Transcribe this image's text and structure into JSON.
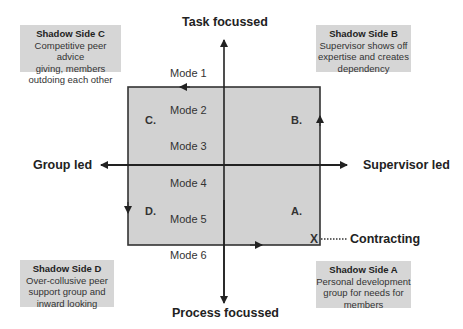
{
  "axes": {
    "top": "Task focussed",
    "bottom": "Process focussed",
    "left": "Group led",
    "right": "Supervisor led"
  },
  "modes": [
    "Mode 1",
    "Mode 2",
    "Mode 3",
    "Mode 4",
    "Mode 5",
    "Mode 6"
  ],
  "quadrants": {
    "a": "A.",
    "b": "B.",
    "c": "C.",
    "d": "D."
  },
  "contracting": {
    "marker": "X",
    "label": "Contracting"
  },
  "shadow_sides": {
    "c": {
      "title": "Shadow Side C",
      "lines": [
        "Competitive peer advice",
        "giving, members",
        "outdoing each other"
      ]
    },
    "b": {
      "title": "Shadow Side B",
      "lines": [
        "Supervisor shows off",
        "expertise and creates",
        "dependency"
      ]
    },
    "d": {
      "title": "Shadow Side D",
      "lines": [
        "Over-collusive peer",
        "support group and",
        "inward looking"
      ]
    },
    "a": {
      "title": "Shadow Side A",
      "lines": [
        "Personal development",
        "group for needs for",
        "members"
      ]
    }
  },
  "colors": {
    "rect_fill": "#d2d2d2",
    "box_fill": "#d6d6d6",
    "line": "#222222"
  }
}
